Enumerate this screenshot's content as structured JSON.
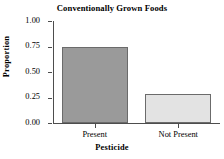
{
  "chart_data": {
    "type": "bar",
    "title": "Conventionally Grown Foods",
    "xlabel": "Pesticide",
    "ylabel": "Proportion",
    "categories": [
      "Present",
      "Not Present"
    ],
    "values": [
      0.75,
      0.28
    ],
    "ylim": [
      0.0,
      1.0
    ],
    "ytick_labels": [
      "0.00",
      "0.25",
      "0.50",
      "0.75",
      "1.00"
    ],
    "ytick_values": [
      0.0,
      0.25,
      0.5,
      0.75,
      1.0
    ],
    "grid": false,
    "legend": "none",
    "bar_colors": [
      "#9a9a9a",
      "#e3e3e3"
    ],
    "bar_border_color": "#6b6b6b",
    "axis_color": "#4d4d4d",
    "background_color": "#ffffff"
  }
}
